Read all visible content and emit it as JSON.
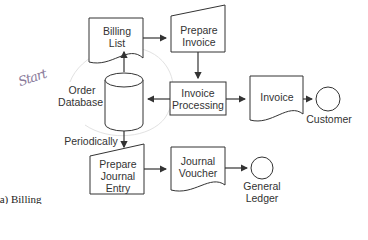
{
  "diagram": {
    "type": "flowchart",
    "caption": "(a) Billing",
    "annotation": "Start",
    "nodes": [
      {
        "id": "billing_list",
        "shape": "document",
        "label_lines": [
          "Billing",
          "List"
        ]
      },
      {
        "id": "prepare_invoice",
        "shape": "manual-operation",
        "label_lines": [
          "Prepare",
          "Invoice"
        ]
      },
      {
        "id": "order_database",
        "shape": "database-cylinder",
        "label_lines": [
          "Order",
          "Database"
        ]
      },
      {
        "id": "invoice_processing",
        "shape": "process",
        "label_lines": [
          "Invoice",
          "Processing"
        ]
      },
      {
        "id": "invoice",
        "shape": "document",
        "label_lines": [
          "Invoice"
        ]
      },
      {
        "id": "customer",
        "shape": "terminal-circle",
        "label_lines": [
          "Customer"
        ]
      },
      {
        "id": "prepare_journal_entry",
        "shape": "manual-operation",
        "label_lines": [
          "Prepare",
          "Journal",
          "Entry"
        ]
      },
      {
        "id": "journal_voucher",
        "shape": "document",
        "label_lines": [
          "Journal",
          "Voucher"
        ]
      },
      {
        "id": "general_ledger",
        "shape": "terminal-circle",
        "label_lines": [
          "General",
          "Ledger"
        ]
      }
    ],
    "edges": [
      {
        "from": "order_database",
        "to": "billing_list",
        "label": ""
      },
      {
        "from": "billing_list",
        "to": "prepare_invoice",
        "label": ""
      },
      {
        "from": "prepare_invoice",
        "to": "invoice_processing",
        "label": ""
      },
      {
        "from": "invoice_processing",
        "to": "order_database",
        "label": ""
      },
      {
        "from": "invoice_processing",
        "to": "invoice",
        "label": ""
      },
      {
        "from": "invoice",
        "to": "customer",
        "label": ""
      },
      {
        "from": "order_database",
        "to": "prepare_journal_entry",
        "label": "Periodically"
      },
      {
        "from": "prepare_journal_entry",
        "to": "journal_voucher",
        "label": ""
      },
      {
        "from": "journal_voucher",
        "to": "general_ledger",
        "label": ""
      }
    ],
    "labels": {
      "billing_list": [
        "Billing",
        "List"
      ],
      "prepare_invoice": [
        "Prepare",
        "Invoice"
      ],
      "order_database": [
        "Order",
        "Database"
      ],
      "invoice_processing": [
        "Invoice",
        "Processing"
      ],
      "invoice": "Invoice",
      "customer": "Customer",
      "periodically": "Periodically",
      "prepare_journal_entry": [
        "Prepare",
        "Journal",
        "Entry"
      ],
      "journal_voucher": [
        "Journal",
        "Voucher"
      ],
      "general_ledger": [
        "General",
        "Ledger"
      ]
    },
    "colors": {
      "stroke": "#333333",
      "text": "#333333",
      "annotation": "#8a7a9a",
      "loop": "#dddddd"
    }
  }
}
